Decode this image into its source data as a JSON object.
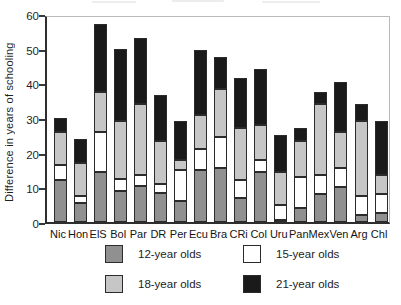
{
  "figure": {
    "background": "#ffffff",
    "axis_color": "#2e2e2e",
    "frame_light_color": "#b9b9b9",
    "text_color": "#1f1f1f"
  },
  "chart_data": {
    "type": "bar",
    "subtype": "stacked-vertical",
    "title": "",
    "xlabel": "",
    "ylabel": "Difference in years of schooling",
    "ylim": [
      0,
      60
    ],
    "yticks": [
      0,
      10,
      20,
      30,
      40,
      50,
      60
    ],
    "grid": false,
    "legend_position": "bottom",
    "categories": [
      "Nic",
      "Hon",
      "ElS",
      "Bol",
      "Par",
      "DR",
      "Per",
      "Ecu",
      "Bra",
      "CRi",
      "Col",
      "Uru",
      "Pan",
      "Mex",
      "Ven",
      "Arg",
      "Chl"
    ],
    "series": [
      {
        "name": "12-year olds",
        "color": "#909090",
        "values": [
          12,
          5.5,
          14.5,
          9,
          10.5,
          8.5,
          6,
          15,
          15.5,
          7,
          14.5,
          0.5,
          4,
          8,
          10,
          2,
          2.5
        ]
      },
      {
        "name": "15-year olds",
        "color": "#ffffff",
        "values": [
          4.5,
          2,
          11.5,
          3.5,
          3,
          2.5,
          9,
          6,
          9,
          5,
          3.5,
          4.5,
          9,
          5.5,
          5.5,
          5.5,
          5.5
        ]
      },
      {
        "name": "18-year olds",
        "color": "#c6c6c6",
        "values": [
          9.5,
          9.5,
          11.5,
          16.5,
          20.5,
          12.5,
          3,
          10,
          14,
          15,
          10,
          9.5,
          10.5,
          20.5,
          10.5,
          21.5,
          5.5
        ]
      },
      {
        "name": "21-year olds",
        "color": "#1a1a1a",
        "values": [
          4,
          7,
          19.5,
          21,
          19,
          13,
          11,
          18.5,
          9,
          14.5,
          16,
          10.5,
          3.5,
          3.5,
          14.5,
          5,
          15.5
        ]
      }
    ],
    "totals": [
      30,
      24,
      57,
      50,
      53,
      36.5,
      29,
      49.5,
      47.5,
      41.5,
      44,
      25,
      27,
      37.5,
      40.5,
      34,
      29
    ]
  }
}
